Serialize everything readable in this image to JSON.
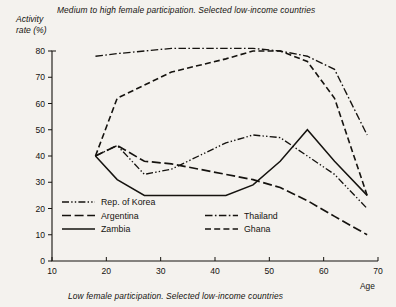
{
  "titles": {
    "top": "Medium to high female participation.  Selected low-income countries",
    "bottom": "Low female participation.  Selected low-income countries",
    "ylabel_line1": "Activity",
    "ylabel_line2": "rate (%)",
    "xlabel": "Age"
  },
  "axes": {
    "y_ticks": [
      "0",
      "10",
      "20",
      "30",
      "40",
      "50",
      "60",
      "70",
      "80"
    ],
    "x_ticks": [
      "10",
      "20",
      "30",
      "40",
      "50",
      "60",
      "70"
    ]
  },
  "legend": {
    "left": [
      {
        "label": "Rep. of Korea",
        "style": "dash-dot-dot"
      },
      {
        "label": "Argentina",
        "style": "long-dash"
      },
      {
        "label": "Zambia",
        "style": "solid"
      }
    ],
    "right": [
      {
        "label": "Thailand",
        "style": "dash-dot"
      },
      {
        "label": "Ghana",
        "style": "dashed"
      }
    ]
  },
  "chart_data": {
    "type": "line",
    "title": "Medium to high female participation.  Selected low-income countries",
    "subtitle": "Low female participation.  Selected low-income countries",
    "xlabel": "Age",
    "ylabel": "Activity rate (%)",
    "xlim": [
      10,
      70
    ],
    "ylim": [
      0,
      80
    ],
    "xticks": [
      10,
      20,
      30,
      40,
      50,
      60,
      70
    ],
    "yticks": [
      0,
      10,
      20,
      30,
      40,
      50,
      60,
      70,
      80
    ],
    "grid": false,
    "legend_position": "inside-lower-left",
    "series": [
      {
        "name": "Thailand",
        "style": "dash-dot",
        "x": [
          18,
          22,
          27,
          32,
          42,
          47,
          52,
          57,
          62,
          68
        ],
        "y": [
          78,
          79,
          80,
          81,
          81,
          81,
          80,
          78,
          73,
          48
        ]
      },
      {
        "name": "Ghana",
        "style": "dashed",
        "x": [
          18,
          22,
          27,
          32,
          42,
          47,
          52,
          57,
          62,
          68
        ],
        "y": [
          40,
          62,
          67,
          72,
          77,
          80,
          80,
          76,
          62,
          25
        ]
      },
      {
        "name": "Rep. of Korea",
        "style": "dash-dot-dot",
        "x": [
          18,
          22,
          27,
          32,
          37,
          42,
          47,
          52,
          57,
          62,
          68
        ],
        "y": [
          40,
          44,
          33,
          35,
          40,
          45,
          48,
          47,
          40,
          33,
          20
        ]
      },
      {
        "name": "Argentina",
        "style": "long-dash",
        "x": [
          18,
          22,
          27,
          32,
          37,
          42,
          47,
          52,
          57,
          62,
          68
        ],
        "y": [
          40,
          44,
          38,
          37,
          35,
          33,
          31,
          28,
          23,
          17,
          10
        ]
      },
      {
        "name": "Zambia",
        "style": "solid",
        "x": [
          18,
          22,
          27,
          32,
          37,
          42,
          47,
          52,
          57,
          62,
          68
        ],
        "y": [
          40,
          31,
          25,
          25,
          25,
          25,
          29,
          38,
          50,
          38,
          25
        ]
      }
    ]
  }
}
